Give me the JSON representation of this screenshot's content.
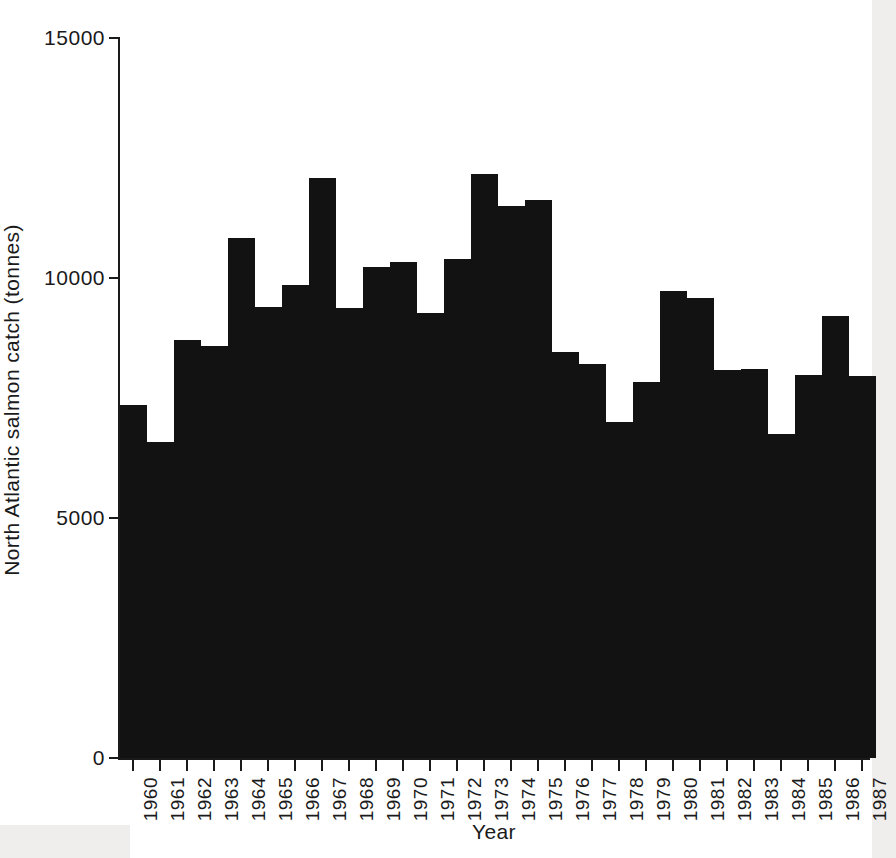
{
  "chart_data": {
    "type": "bar",
    "title": "",
    "xlabel": "Year",
    "ylabel": "North Atlantic salmon catch (tonnes)",
    "categories": [
      "1960",
      "1961",
      "1962",
      "1963",
      "1964",
      "1965",
      "1966",
      "1967",
      "1968",
      "1969",
      "1970",
      "1971",
      "1972",
      "1973",
      "1974",
      "1975",
      "1976",
      "1977",
      "1978",
      "1979",
      "1980",
      "1981",
      "1982",
      "1983",
      "1984",
      "1985",
      "1986",
      "1987"
    ],
    "values": [
      7350,
      6580,
      8700,
      8580,
      10830,
      9400,
      9850,
      12080,
      9370,
      10230,
      10330,
      9270,
      10400,
      12170,
      11500,
      11620,
      8460,
      8200,
      7000,
      7830,
      9730,
      9580,
      8080,
      8100,
      6750,
      7980,
      9210,
      7950
    ],
    "ylim": [
      0,
      15000
    ],
    "yticks": [
      0,
      5000,
      10000,
      15000
    ],
    "ytick_labels": [
      "0",
      "5000",
      "10000",
      "15000"
    ],
    "grid": false,
    "legend": null,
    "bar_color": "#121212",
    "axis_color": "#1a1a1a",
    "background": "#ffffff"
  }
}
